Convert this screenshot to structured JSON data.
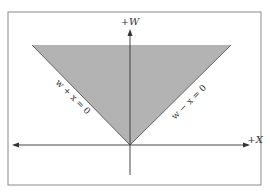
{
  "diagram": {
    "axes": {
      "vertical_label": "+W",
      "horizontal_label": "+X"
    },
    "lines": {
      "left": {
        "label": "w + x = 0"
      },
      "right": {
        "label": "w − x = 0"
      }
    },
    "colors": {
      "region_fill": "#b3b3b3",
      "frame": "#8a8a8a",
      "axis": "#333333",
      "background": "#ffffff"
    }
  }
}
